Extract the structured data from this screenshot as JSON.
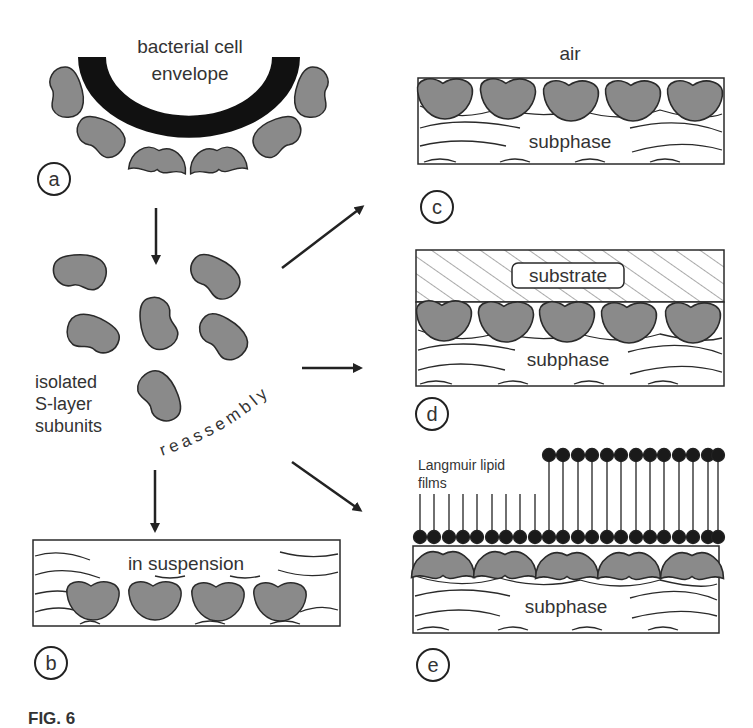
{
  "figure": {
    "panels": {
      "a": {
        "letter": "a",
        "title_line1": "bacterial cell",
        "title_line2": "envelope"
      },
      "b": {
        "letter": "b",
        "label": "in suspension"
      },
      "c": {
        "letter": "c",
        "top_label": "air",
        "label": "subphase"
      },
      "d": {
        "letter": "d",
        "substrate_label": "substrate",
        "label": "subphase"
      },
      "e": {
        "letter": "e",
        "film_label_line1": "Langmuir lipid",
        "film_label_line2": "films",
        "label": "subphase"
      }
    },
    "isolated": {
      "line1": "isolated",
      "line2": "S-layer",
      "line3": "subunits"
    },
    "process_label": "reassembly",
    "caption_fragment": "FIG. 6"
  },
  "colors": {
    "subunit_fill": "#8a8a8a",
    "subunit_stroke": "#2a2a2a",
    "envelope": "#111111",
    "lipid_head": "#1a1a1a",
    "line": "#2a2a2a"
  }
}
